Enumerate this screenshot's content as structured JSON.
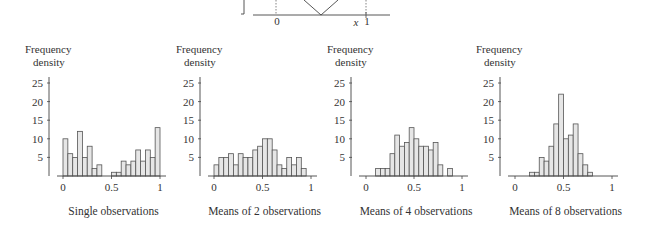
{
  "top_diagram": {
    "x_tick_labels": [
      "0",
      "1"
    ],
    "x_label": "x",
    "shape": "V-shaped (bottom of U-shaped distribution)"
  },
  "chart_data": [
    {
      "type": "bar",
      "title": "Single observations",
      "ylabel": "Frequency density",
      "ylabel_lines": [
        "Frequency",
        "density"
      ],
      "xlabel": "Single observations",
      "bin_width": 0.05,
      "bin_starts": [
        0,
        0.05,
        0.1,
        0.15,
        0.2,
        0.25,
        0.3,
        0.35,
        0.4,
        0.45,
        0.5,
        0.55,
        0.6,
        0.65,
        0.7,
        0.75,
        0.8,
        0.85,
        0.9,
        0.95
      ],
      "values": [
        10,
        6,
        5,
        12,
        5,
        8,
        2,
        3,
        0,
        0,
        1,
        1,
        4,
        3,
        4,
        7,
        4,
        7,
        5,
        13
      ],
      "xlim": [
        0,
        1
      ],
      "ylim": [
        0,
        25
      ],
      "x_ticks": [
        "0",
        "0.5",
        "1"
      ],
      "y_ticks": [
        "5",
        "10",
        "15",
        "20",
        "25"
      ]
    },
    {
      "type": "bar",
      "title": "Means of 2 observations",
      "ylabel": "Frequency density",
      "ylabel_lines": [
        "Frequency",
        "density"
      ],
      "xlabel": "Means of 2 observations",
      "bin_width": 0.05,
      "bin_starts": [
        0,
        0.05,
        0.1,
        0.15,
        0.2,
        0.25,
        0.3,
        0.35,
        0.4,
        0.45,
        0.5,
        0.55,
        0.6,
        0.65,
        0.7,
        0.75,
        0.8,
        0.85,
        0.9,
        0.95
      ],
      "values": [
        3,
        5,
        5,
        6,
        3,
        6,
        5,
        5,
        7,
        8,
        10,
        10,
        7,
        3,
        2,
        5,
        3,
        5,
        2,
        0
      ],
      "xlim": [
        0,
        1
      ],
      "ylim": [
        0,
        25
      ],
      "x_ticks": [
        "0",
        "0.5",
        "1"
      ],
      "y_ticks": [
        "5",
        "10",
        "15",
        "20",
        "25"
      ]
    },
    {
      "type": "bar",
      "title": "Means of 4 observations",
      "ylabel": "Frequency density",
      "ylabel_lines": [
        "Frequency",
        "density"
      ],
      "xlabel": "Means of 4 observations",
      "bin_width": 0.05,
      "bin_starts": [
        0,
        0.05,
        0.1,
        0.15,
        0.2,
        0.25,
        0.3,
        0.35,
        0.4,
        0.45,
        0.5,
        0.55,
        0.6,
        0.65,
        0.7,
        0.75,
        0.8,
        0.85,
        0.9,
        0.95
      ],
      "values": [
        0,
        0,
        2,
        2,
        2,
        6,
        11,
        8,
        9,
        13,
        10,
        8,
        8,
        7,
        9,
        3,
        0,
        2,
        0,
        0
      ],
      "xlim": [
        0,
        1
      ],
      "ylim": [
        0,
        25
      ],
      "x_ticks": [
        "0",
        "0.5",
        "1"
      ],
      "y_ticks": [
        "5",
        "10",
        "15",
        "20",
        "25"
      ]
    },
    {
      "type": "bar",
      "title": "Means of 8 observations",
      "ylabel": "Frequency density",
      "ylabel_lines": [
        "Frequency",
        "density"
      ],
      "xlabel": "Means of 8 observations",
      "bin_width": 0.05,
      "bin_starts": [
        0,
        0.05,
        0.1,
        0.15,
        0.2,
        0.25,
        0.3,
        0.35,
        0.4,
        0.45,
        0.5,
        0.55,
        0.6,
        0.65,
        0.7,
        0.75,
        0.8,
        0.85,
        0.9,
        0.95
      ],
      "values": [
        0,
        0,
        0,
        1,
        1,
        5,
        4,
        8,
        14,
        22,
        10,
        11,
        14,
        6,
        3,
        1,
        0,
        0,
        0,
        0
      ],
      "xlim": [
        0,
        1
      ],
      "ylim": [
        0,
        25
      ],
      "x_ticks": [
        "0",
        "0.5",
        "1"
      ],
      "y_ticks": [
        "5",
        "10",
        "15",
        "20",
        "25"
      ]
    }
  ]
}
